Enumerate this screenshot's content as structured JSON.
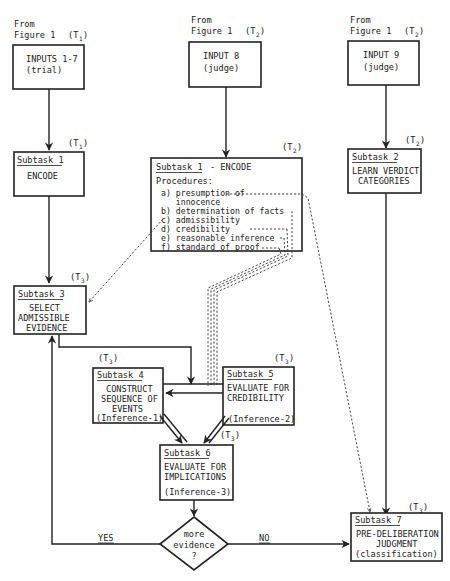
{
  "diagram": {
    "sources": [
      {
        "id": "src1",
        "line1": "From",
        "line2": "Figure 1",
        "time": "(T",
        "time_sub": "1",
        "time_close": ")"
      },
      {
        "id": "src2",
        "line1": "From",
        "line2": "Figure 1",
        "time": "(T",
        "time_sub": "2",
        "time_close": ")"
      },
      {
        "id": "src3",
        "line1": "From",
        "line2": "Figure 1",
        "time": "(T",
        "time_sub": "2",
        "time_close": ")"
      }
    ],
    "inputs": [
      {
        "id": "inputs_1_7",
        "line1": "INPUTS 1-7",
        "line2": "(trial)"
      },
      {
        "id": "input_8",
        "line1": "INPUT 8",
        "line2": "(judge)"
      },
      {
        "id": "input_9",
        "line1": "INPUT 9",
        "line2": "(judge)"
      }
    ],
    "subtask1_left": {
      "title": "Subtask 1",
      "body": "ENCODE",
      "time": "(T",
      "time_sub": "1"
    },
    "subtask1_judge": {
      "title": "Subtask 1",
      "title_suffix": "- ENCODE",
      "procedures_label": "Procedures:",
      "time": "(T",
      "time_sub": "2",
      "procedures": [
        "a) presumption of",
        "   innocence",
        "b) determination of facts",
        "c) admissibility",
        "d) credibility",
        "e) reasonable inference",
        "f) standard of proof"
      ]
    },
    "subtask2": {
      "title": "Subtask 2",
      "line1": "LEARN VERDICT",
      "line2": "CATEGORIES",
      "time": "(T",
      "time_sub": "2"
    },
    "subtask3": {
      "title": "Subtask 3",
      "line1": "SELECT",
      "line2": "ADMISSIBLE",
      "line3": "EVIDENCE",
      "time": "(T",
      "time_sub": "3"
    },
    "subtask4": {
      "title": "Subtask 4",
      "line1": "CONSTRUCT",
      "line2": "SEQUENCE OF",
      "line3": "EVENTS",
      "line4": "(Inference-1)",
      "time": "(T",
      "time_sub": "3"
    },
    "subtask5": {
      "title": "Subtask 5",
      "line1": "EVALUATE FOR",
      "line2": "CREDIBILITY",
      "line3": "(Inference-2)",
      "time": "(T",
      "time_sub": "3"
    },
    "subtask6": {
      "title": "Subtask 6",
      "line1": "EVALUATE FOR",
      "line2": "IMPLICATIONS",
      "line3": "(Inference-3)",
      "time": "(T",
      "time_sub": "3"
    },
    "subtask7": {
      "title": "Subtask 7",
      "line1": "PRE-DELIBERATION",
      "line2": "JUDGMENT",
      "line3": "(classification)",
      "time": "(T",
      "time_sub": "3"
    },
    "decision": {
      "line1": "more",
      "line2": "evidence",
      "line3": "?",
      "yes_label": "YES",
      "no_label": "NO"
    }
  }
}
